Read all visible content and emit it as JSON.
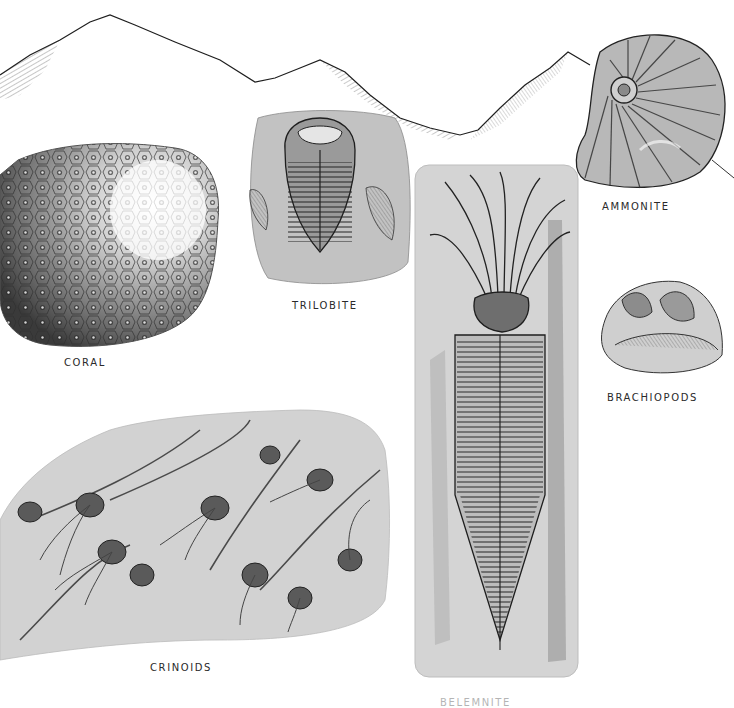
{
  "plate": {
    "type": "fossil-illustration-plate",
    "palette": {
      "ink": "#1e1e1e",
      "wash_dark": "#6e6e6e",
      "wash_mid": "#a8a8a8",
      "wash_light": "#d6d6d6",
      "paper": "#ffffff"
    }
  },
  "labels": {
    "ammonite": "AMMONITE",
    "trilobite": "TRILOBITE",
    "coral": "CORAL",
    "brachiopods": "BRACHIOPODS",
    "crinoids": "CRINOIDS",
    "belemnite": "BELEMNITE"
  },
  "figures": [
    {
      "name": "mountain-ridge",
      "label": null
    },
    {
      "name": "ammonite",
      "label": "AMMONITE"
    },
    {
      "name": "trilobite",
      "label": "TRILOBITE"
    },
    {
      "name": "coral",
      "label": "CORAL"
    },
    {
      "name": "brachiopods",
      "label": "BRACHIOPODS"
    },
    {
      "name": "crinoids",
      "label": "CRINOIDS"
    },
    {
      "name": "belemnite",
      "label": "BELEMNITE"
    }
  ]
}
